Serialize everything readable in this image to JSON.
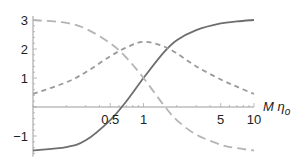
{
  "chart_data": {
    "type": "line",
    "title": "",
    "xlabel": "M η",
    "xlabel_subscript": "o",
    "ylabel": "",
    "xscale": "log",
    "xlim": [
      0.1,
      10
    ],
    "ylim": [
      -1.5,
      3
    ],
    "grid": false,
    "legend": "none",
    "x_ticks": [
      {
        "value": 0.5,
        "label": "0.5"
      },
      {
        "value": 1,
        "label": "1"
      },
      {
        "value": 5,
        "label": "5"
      },
      {
        "value": 10,
        "label": "10"
      }
    ],
    "y_ticks": [
      {
        "value": 3,
        "label": "3"
      },
      {
        "value": 2,
        "label": "2"
      },
      {
        "value": 1,
        "label": "1"
      },
      {
        "value": -1,
        "label": "−1"
      }
    ],
    "x": [
      0.1,
      0.2,
      0.3,
      0.5,
      0.7,
      1,
      1.5,
      2,
      3,
      5,
      7,
      10
    ],
    "series": [
      {
        "name": "solid",
        "style": "solid",
        "color": "#6e6e6e",
        "values": [
          -1.5,
          -1.38,
          -1.15,
          -0.45,
          0.2,
          1.0,
          1.85,
          2.3,
          2.65,
          2.88,
          2.95,
          3.0
        ]
      },
      {
        "name": "long-dashed",
        "style": "long-dash",
        "color": "#b4b4b4",
        "values": [
          3.0,
          2.9,
          2.7,
          2.2,
          1.7,
          1.0,
          0.1,
          -0.45,
          -0.95,
          -1.3,
          -1.42,
          -1.5
        ]
      },
      {
        "name": "short-dashed",
        "style": "short-dash",
        "color": "#9a9a9a",
        "values": [
          0.45,
          0.85,
          1.2,
          1.75,
          2.05,
          2.25,
          2.1,
          1.85,
          1.4,
          0.95,
          0.7,
          0.45
        ]
      }
    ]
  }
}
